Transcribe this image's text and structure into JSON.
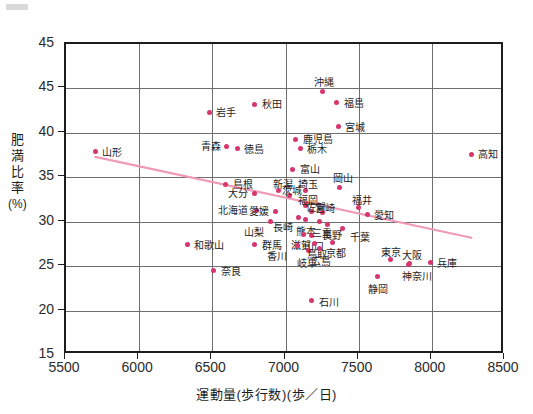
{
  "chart_data": {
    "type": "scatter",
    "title": "",
    "xlabel": "運動量(歩行数)(歩／日)",
    "ylabel": "肥満比率(%)",
    "ylabel_chars": [
      "肥",
      "満",
      "比",
      "率",
      "(%)"
    ],
    "xlim": [
      5500,
      8500
    ],
    "ylim": [
      15,
      50
    ],
    "xticks": [
      5500,
      6000,
      6500,
      7000,
      7500,
      8000,
      8500
    ],
    "yticks": [
      15,
      20,
      25,
      30,
      35,
      40,
      45,
      45
    ],
    "ytick_labels": [
      "15",
      "20",
      "25",
      "30",
      "35",
      "40",
      "45",
      "45"
    ],
    "grid": true,
    "legend": false,
    "point_color": "#d6366b",
    "trendline": {
      "show": true,
      "color": "#f09ab8",
      "x_start": 5700,
      "y_start": 37.3,
      "x_end": 8270,
      "y_end": 28.2
    },
    "points": [
      {
        "name": "山形",
        "x": 5700,
        "y": 37.9,
        "label_dx": 7,
        "label_dy": -4
      },
      {
        "name": "和歌山",
        "x": 6330,
        "y": 27.4,
        "label_dx": 7,
        "label_dy": -4
      },
      {
        "name": "奈良",
        "x": 6510,
        "y": 24.5,
        "label_dx": 7,
        "label_dy": -4
      },
      {
        "name": "岩手",
        "x": 6480,
        "y": 42.3,
        "label_dx": 7,
        "label_dy": -4
      },
      {
        "name": "青森",
        "x": 6600,
        "y": 38.5,
        "label_dx": -26,
        "label_dy": -4
      },
      {
        "name": "徳島",
        "x": 6670,
        "y": 38.2,
        "label_dx": 7,
        "label_dy": -4
      },
      {
        "name": "島根",
        "x": 6590,
        "y": 34.2,
        "label_dx": 7,
        "label_dy": -4
      },
      {
        "name": "大分",
        "x": 6790,
        "y": 33.2,
        "label_dx": -27,
        "label_dy": -4
      },
      {
        "name": "北海道",
        "x": 6800,
        "y": 31.3,
        "label_dx": -38,
        "label_dy": -4
      },
      {
        "name": "秋田",
        "x": 6790,
        "y": 43.2,
        "label_dx": 7,
        "label_dy": -4
      },
      {
        "name": "山梨",
        "x": 6900,
        "y": 30.0,
        "label_dx": -27,
        "label_dy": 6
      },
      {
        "name": "群馬",
        "x": 6790,
        "y": 27.4,
        "label_dx": 7,
        "label_dy": -4
      },
      {
        "name": "新潟",
        "x": 6950,
        "y": 33.5,
        "label_dx": -5,
        "label_dy": -11
      },
      {
        "name": "愛媛",
        "x": 6930,
        "y": 31.2,
        "label_dx": -26,
        "label_dy": -4
      },
      {
        "name": "茨城",
        "x": 7030,
        "y": 32.9,
        "label_dx": -8,
        "label_dy": -10
      },
      {
        "name": "鹿児島",
        "x": 7070,
        "y": 39.3,
        "label_dx": 7,
        "label_dy": -4
      },
      {
        "name": "栃木",
        "x": 7100,
        "y": 38.2,
        "label_dx": 7,
        "label_dy": -4
      },
      {
        "name": "富山",
        "x": 7050,
        "y": 35.9,
        "label_dx": 7,
        "label_dy": -4
      },
      {
        "name": "埼玉",
        "x": 7140,
        "y": 33.5,
        "label_dx": -8,
        "label_dy": -11
      },
      {
        "name": "福岡",
        "x": 7140,
        "y": 31.8,
        "label_dx": -8,
        "label_dy": -10
      },
      {
        "name": "長崎",
        "x": 7090,
        "y": 30.5,
        "label_dx": -26,
        "label_dy": 6
      },
      {
        "name": "熊本",
        "x": 7140,
        "y": 30.2,
        "label_dx": -10,
        "label_dy": 7
      },
      {
        "name": "佐賀",
        "x": 7180,
        "y": 31.1,
        "label_dx": -6,
        "label_dy": -9
      },
      {
        "name": "滋賀",
        "x": 7120,
        "y": 28.6,
        "label_dx": -12,
        "label_dy": 7
      },
      {
        "name": "山口",
        "x": 7180,
        "y": 28.5,
        "label_dx": -8,
        "label_dy": 7
      },
      {
        "name": "香川",
        "x": 7080,
        "y": 27.3,
        "label_dx": -30,
        "label_dy": 6
      },
      {
        "name": "岐阜",
        "x": 7160,
        "y": 26.8,
        "label_dx": -12,
        "label_dy": 9
      },
      {
        "name": "鳥取",
        "x": 7200,
        "y": 27.5,
        "label_dx": -8,
        "label_dy": 6
      },
      {
        "name": "沖縄",
        "x": 7250,
        "y": 44.7,
        "label_dx": -8,
        "label_dy": -13
      },
      {
        "name": "石川",
        "x": 7180,
        "y": 21.1,
        "label_dx": 7,
        "label_dy": -3
      },
      {
        "name": "三重",
        "x": 7230,
        "y": 30.0,
        "label_dx": -7,
        "label_dy": 7
      },
      {
        "name": "宮崎",
        "x": 7250,
        "y": 31.0,
        "label_dx": -7,
        "label_dy": -9
      },
      {
        "name": "広島",
        "x": 7230,
        "y": 27.0,
        "label_dx": -8,
        "label_dy": 9
      },
      {
        "name": "長野",
        "x": 7290,
        "y": 29.7,
        "label_dx": -6,
        "label_dy": 7
      },
      {
        "name": "京都",
        "x": 7320,
        "y": 27.7,
        "label_dx": -6,
        "label_dy": 7
      },
      {
        "name": "福島",
        "x": 7350,
        "y": 43.4,
        "label_dx": 7,
        "label_dy": -4
      },
      {
        "name": "宮城",
        "x": 7360,
        "y": 40.7,
        "label_dx": 7,
        "label_dy": -4
      },
      {
        "name": "岡山",
        "x": 7370,
        "y": 33.9,
        "label_dx": -7,
        "label_dy": -13
      },
      {
        "name": "千葉",
        "x": 7390,
        "y": 29.2,
        "label_dx": 7,
        "label_dy": 4
      },
      {
        "name": "福井",
        "x": 7500,
        "y": 31.6,
        "label_dx": -7,
        "label_dy": -11
      },
      {
        "name": "愛知",
        "x": 7560,
        "y": 30.8,
        "label_dx": 7,
        "label_dy": -4
      },
      {
        "name": "静岡",
        "x": 7630,
        "y": 23.8,
        "label_dx": -10,
        "label_dy": 8
      },
      {
        "name": "東京",
        "x": 7720,
        "y": 25.8,
        "label_dx": -10,
        "label_dy": -11
      },
      {
        "name": "大阪",
        "x": 7850,
        "y": 25.3,
        "label_dx": -8,
        "label_dy": -12
      },
      {
        "name": "神奈川",
        "x": 7840,
        "y": 25.2,
        "label_dx": -6,
        "label_dy": 8
      },
      {
        "name": "兵庫",
        "x": 7990,
        "y": 25.4,
        "label_dx": 7,
        "label_dy": -4
      },
      {
        "name": "高知",
        "x": 8270,
        "y": 37.6,
        "label_dx": 7,
        "label_dy": -4
      }
    ]
  }
}
